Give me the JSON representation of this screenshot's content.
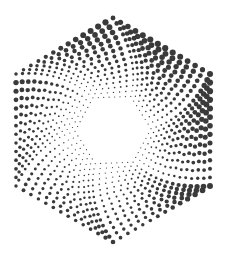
{
  "artwork": {
    "label": "Halftone twisted hexagon",
    "background": "#ffffff",
    "dot_color": "#3a3a3a",
    "center": [
      113,
      130
    ],
    "outer_radius": 112,
    "inner_radius": 38,
    "rings": 15,
    "dots_per_edge_outer": 13,
    "twist_degrees": 28,
    "max_dot_radius": 3.1,
    "min_dot_radius": 0.6
  }
}
